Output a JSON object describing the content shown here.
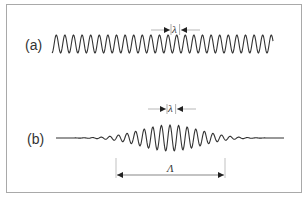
{
  "figure": {
    "panels": [
      {
        "label": "(a)",
        "description": "continuous sinusoidal wave",
        "wavelength_symbol": "λ"
      },
      {
        "label": "(b)",
        "description": "wave packet with Gaussian envelope",
        "wavelength_symbol": "λ",
        "envelope_width_symbol": "Λ"
      }
    ],
    "colors": {
      "wave": "#333333",
      "annotation": "#222222",
      "guide": "#999999",
      "frame": "#a9a9a9"
    }
  },
  "geometry": {
    "a": {
      "x0": 52,
      "x1": 273,
      "y": 44,
      "amp": 9,
      "period": 8.6
    },
    "b": {
      "x0": 56,
      "x1": 284,
      "y": 138,
      "amp": 13,
      "period": 8.6,
      "center": 170,
      "sigma": 30
    }
  }
}
